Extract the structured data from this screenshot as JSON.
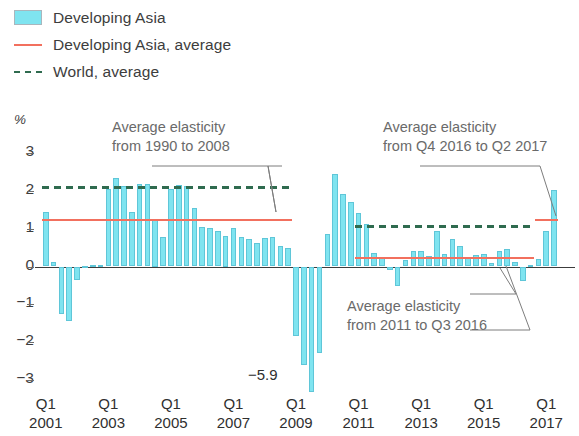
{
  "legend": {
    "items": [
      {
        "label": "Developing Asia",
        "marker": "swatch",
        "color": "#7fe4f0"
      },
      {
        "label": "Developing Asia, average",
        "marker": "solid-line",
        "color": "#f2705e"
      },
      {
        "label": "World, average",
        "marker": "dashed-line",
        "color": "#2f6b4f"
      }
    ]
  },
  "axis": {
    "y_unit": "%",
    "y_ticks": [
      "3",
      "2",
      "1",
      "0",
      "−1",
      "−2",
      "−3"
    ],
    "x_quarter_labels": [
      "Q1",
      "Q1",
      "Q1",
      "Q1",
      "Q1",
      "Q1",
      "Q1",
      "Q1",
      "Q1"
    ],
    "x_year_labels": [
      "2001",
      "2003",
      "2005",
      "2007",
      "2009",
      "2011",
      "2013",
      "2015",
      "2017"
    ]
  },
  "annotations": [
    {
      "id": "annot-1990-2008",
      "line1": "Average elasticity",
      "line2": "from 1990 to 2008"
    },
    {
      "id": "annot-q4-2016",
      "line1": "Average elasticity",
      "line2": "from Q4 2016 to Q2 2017"
    },
    {
      "id": "annot-2011-q3-2016",
      "line1": "Average elasticity",
      "line2": "from 2011 to Q3 2016"
    }
  ],
  "outlier_label": {
    "text": "−5.9"
  },
  "chart_data": {
    "type": "bar",
    "title": "",
    "xlabel": "",
    "ylabel": "%",
    "ylim": [
      -3.3,
      3.3
    ],
    "grid": false,
    "legend_position": "top-left",
    "bar_color": "#7fe4f0",
    "categories": [
      "Q1 2001",
      "Q2 2001",
      "Q3 2001",
      "Q4 2001",
      "Q1 2002",
      "Q2 2002",
      "Q3 2002",
      "Q4 2002",
      "Q1 2003",
      "Q2 2003",
      "Q3 2003",
      "Q4 2003",
      "Q1 2004",
      "Q2 2004",
      "Q3 2004",
      "Q4 2004",
      "Q1 2005",
      "Q2 2005",
      "Q3 2005",
      "Q4 2005",
      "Q1 2006",
      "Q2 2006",
      "Q3 2006",
      "Q4 2006",
      "Q1 2007",
      "Q2 2007",
      "Q3 2007",
      "Q4 2007",
      "Q1 2008",
      "Q2 2008",
      "Q3 2008",
      "Q4 2008",
      "Q1 2009",
      "Q2 2009",
      "Q3 2009",
      "Q4 2009",
      "Q1 2010",
      "Q2 2010",
      "Q3 2010",
      "Q4 2010",
      "Q1 2011",
      "Q2 2011",
      "Q3 2011",
      "Q4 2011",
      "Q1 2012",
      "Q2 2012",
      "Q3 2012",
      "Q4 2012",
      "Q1 2013",
      "Q2 2013",
      "Q3 2013",
      "Q4 2013",
      "Q1 2014",
      "Q2 2014",
      "Q3 2014",
      "Q4 2014",
      "Q1 2015",
      "Q2 2015",
      "Q3 2015",
      "Q4 2015",
      "Q1 2016",
      "Q2 2016",
      "Q3 2016",
      "Q4 2016",
      "Q1 2017",
      "Q2 2017"
    ],
    "values": [
      1.45,
      0.12,
      -1.25,
      -1.45,
      -0.35,
      0.02,
      0.03,
      0.05,
      2.05,
      2.35,
      2.12,
      1.45,
      2.18,
      2.18,
      1.25,
      0.78,
      2.05,
      2.15,
      2.12,
      1.55,
      1.05,
      1.02,
      0.95,
      0.82,
      1.02,
      0.78,
      0.72,
      0.62,
      0.75,
      0.78,
      0.55,
      0.48,
      -1.85,
      -2.6,
      -5.9,
      -2.3,
      0.85,
      2.45,
      1.92,
      1.7,
      1.42,
      1.12,
      0.35,
      0.22,
      -0.1,
      -0.52,
      0.18,
      0.42,
      0.4,
      0.28,
      0.95,
      0.32,
      0.72,
      0.55,
      0.25,
      0.3,
      0.32,
      0.08,
      0.42,
      0.45,
      0.12,
      -0.38,
      0.05,
      0.2,
      0.95,
      2.02
    ],
    "reference_lines": [
      {
        "name": "Developing Asia, average, 1990-2008",
        "value": 1.25,
        "style": "solid",
        "color": "#f2705e",
        "from": "Q1 2001",
        "to": "Q4 2008"
      },
      {
        "name": "World, average, 1990-2008",
        "value": 2.12,
        "style": "dashed",
        "color": "#2f6b4f",
        "from": "Q1 2001",
        "to": "Q4 2008"
      },
      {
        "name": "Developing Asia, average, 2011-Q3 2016",
        "value": 0.26,
        "style": "solid",
        "color": "#f2705e",
        "from": "Q1 2011",
        "to": "Q3 2016"
      },
      {
        "name": "World, average, 2011-Q3 2016",
        "value": 1.1,
        "style": "dashed",
        "color": "#2f6b4f",
        "from": "Q1 2011",
        "to": "Q3 2016"
      },
      {
        "name": "Developing Asia, average, Q4 2016-Q2 2017",
        "value": 1.25,
        "style": "solid",
        "color": "#f2705e",
        "from": "Q4 2016",
        "to": "Q2 2017"
      }
    ]
  }
}
